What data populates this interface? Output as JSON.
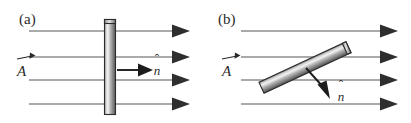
{
  "figure": {
    "background_color": "#ffffff",
    "width": 411,
    "height": 123,
    "line_color": "#575757",
    "arrow_color": "#2e2e2e",
    "plate_outline_color": "#2b2b2b",
    "plate_light_color": "#f2f2f2",
    "plate_mid_color": "#9a9a9a",
    "plate_dark_color": "#4e4e4e",
    "text_color": "#2a2a2a"
  },
  "panels": [
    {
      "id": "panel-a",
      "label": "(a)",
      "field_vector_label": "A",
      "normal_vector_label": "n",
      "normal_direction": "horizontal-right",
      "plate_orientation": "vertical",
      "plate_angle_deg": 0,
      "field_line_count": 4
    },
    {
      "id": "panel-b",
      "label": "(b)",
      "field_vector_label": "A",
      "normal_vector_label": "n",
      "normal_direction": "down-right",
      "plate_orientation": "tilted",
      "plate_angle_deg": -25,
      "field_line_count": 4
    }
  ],
  "symbols": {
    "vector_arrow_accent": "→",
    "unit_vector_accent": "ˆ"
  }
}
